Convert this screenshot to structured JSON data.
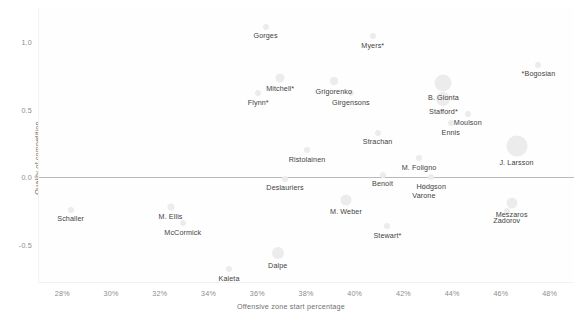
{
  "chart_data": {
    "type": "scatter",
    "title": "",
    "xlabel": "Offensive zone start percentage",
    "ylabel": "Quality of competition",
    "xlim": [
      27.0,
      49.0
    ],
    "ylim": [
      -0.78,
      1.25
    ],
    "grid": false,
    "legend": "none",
    "xticks": [
      "28%",
      "30%",
      "32%",
      "34%",
      "36%",
      "38%",
      "40%",
      "42%",
      "44%",
      "46%",
      "48%"
    ],
    "xtick_values": [
      28,
      30,
      32,
      34,
      36,
      38,
      40,
      42,
      44,
      46,
      48
    ],
    "yticks": [
      "1.0",
      "0.5",
      "0.0",
      "-0.5"
    ],
    "ytick_values": [
      1.0,
      0.5,
      0.0,
      -0.5
    ],
    "reference_line_y": 0.0,
    "marker": "bubble",
    "marker_color": "#ececec",
    "label_color": "#3f3f3f",
    "axis_color": "#8d8d8d",
    "points": [
      {
        "label": "Gorges",
        "x": 36.3,
        "y": 1.11,
        "size": 6
      },
      {
        "label": "Myers*",
        "x": 40.7,
        "y": 1.04,
        "size": 6
      },
      {
        "label": "*Bogosian",
        "x": 47.5,
        "y": 0.83,
        "size": 6
      },
      {
        "label": "Mitchell*",
        "x": 36.9,
        "y": 0.73,
        "size": 9
      },
      {
        "label": "Grigorenko",
        "x": 39.1,
        "y": 0.71,
        "size": 8
      },
      {
        "label": "B. Gionta",
        "x": 43.6,
        "y": 0.7,
        "size": 17
      },
      {
        "label": "Flynn*",
        "x": 36.0,
        "y": 0.62,
        "size": 6
      },
      {
        "label": "Girgensons",
        "x": 39.8,
        "y": 0.62,
        "size": 6
      },
      {
        "label": "Stafford*",
        "x": 43.6,
        "y": 0.58,
        "size": 14
      },
      {
        "label": "Moulson",
        "x": 44.6,
        "y": 0.47,
        "size": 6
      },
      {
        "label": "Ennis",
        "x": 43.9,
        "y": 0.4,
        "size": 6
      },
      {
        "label": "Strachan",
        "x": 40.9,
        "y": 0.33,
        "size": 6
      },
      {
        "label": "J. Larsson",
        "x": 46.6,
        "y": 0.23,
        "size": 21
      },
      {
        "label": "Ristolainen",
        "x": 38.0,
        "y": 0.2,
        "size": 6
      },
      {
        "label": "M. Foligno",
        "x": 42.6,
        "y": 0.14,
        "size": 6
      },
      {
        "label": "Benoit",
        "x": 41.1,
        "y": 0.02,
        "size": 6
      },
      {
        "label": "Hodgson",
        "x": 43.1,
        "y": 0.0,
        "size": 6
      },
      {
        "label": "Deslauriers",
        "x": 37.1,
        "y": -0.01,
        "size": 6
      },
      {
        "label": "Varone",
        "x": 42.8,
        "y": -0.07,
        "size": 6
      },
      {
        "label": "M. Weber",
        "x": 39.6,
        "y": -0.17,
        "size": 11
      },
      {
        "label": "Meszaros",
        "x": 46.4,
        "y": -0.19,
        "size": 11
      },
      {
        "label": "M. Ellis",
        "x": 32.4,
        "y": -0.22,
        "size": 7
      },
      {
        "label": "Schaller",
        "x": 28.3,
        "y": -0.24,
        "size": 6
      },
      {
        "label": "Zadorov",
        "x": 46.2,
        "y": -0.25,
        "size": 6
      },
      {
        "label": "McCormick",
        "x": 32.9,
        "y": -0.34,
        "size": 6
      },
      {
        "label": "Stewart*",
        "x": 41.3,
        "y": -0.36,
        "size": 6
      },
      {
        "label": "Dalpe",
        "x": 36.8,
        "y": -0.56,
        "size": 12
      },
      {
        "label": "Kaleta",
        "x": 34.8,
        "y": -0.68,
        "size": 6
      }
    ]
  }
}
